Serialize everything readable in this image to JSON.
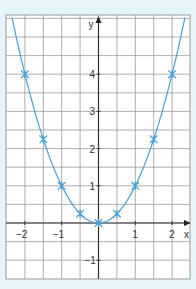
{
  "chart_data": {
    "type": "line",
    "title": "",
    "xlabel": "x",
    "ylabel": "y",
    "xlim": [
      -2.5,
      2.5
    ],
    "ylim": [
      -1.5,
      5.5
    ],
    "grid": true,
    "x_ticks": [
      "-2",
      "-1",
      "1",
      "2"
    ],
    "y_ticks": [
      "-1",
      "1",
      "2",
      "3",
      "4"
    ],
    "series": [
      {
        "name": "y = x^2",
        "color": "#4a9fd6",
        "points": [
          {
            "x": -2,
            "y": 4
          },
          {
            "x": -1.5,
            "y": 2.25
          },
          {
            "x": -1,
            "y": 1
          },
          {
            "x": -0.5,
            "y": 0.25
          },
          {
            "x": 0,
            "y": 0
          },
          {
            "x": 0.5,
            "y": 0.25
          },
          {
            "x": 1,
            "y": 1
          },
          {
            "x": 1.5,
            "y": 2.25
          },
          {
            "x": 2,
            "y": 4
          }
        ]
      }
    ]
  }
}
